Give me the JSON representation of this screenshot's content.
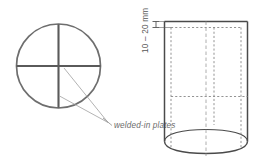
{
  "figure": {
    "background_color": "#ffffff"
  },
  "cross_section_view": {
    "name": "pipe-cross-section",
    "outline_color": "#6e6e6e",
    "plate_color": "#5a5a5a",
    "circle": {
      "cx": 58.5,
      "cy": 66,
      "r": 42
    },
    "plates": [
      {
        "orientation": "vertical",
        "label": "vertical-plate"
      },
      {
        "orientation": "horizontal",
        "label": "horizontal-plate"
      }
    ]
  },
  "annotation": {
    "label": "welded-in plates",
    "text_color": "#6b6b6b",
    "leader_color": "#9a9a9a",
    "leader_lines": 2
  },
  "side_view": {
    "name": "pipe-side-view",
    "outline_color": "#4a4a4a",
    "hidden_line_color": "#8d8d8d",
    "centerline_color": "#9a9a9a",
    "shape": "cylinder",
    "hidden_plate_edges": 3,
    "bottom_opening": "ellipse"
  },
  "dimension": {
    "label": "10 – 20 mm",
    "value_min": 10,
    "value_max": 20,
    "unit": "mm",
    "orientation": "vertical",
    "line_color": "#555555",
    "describes": "plate inset depth from pipe end"
  }
}
